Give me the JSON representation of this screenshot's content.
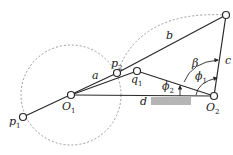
{
  "diagram": {
    "type": "four-bar linkage geometry",
    "colors": {
      "line": "#2a2a2a",
      "dashed": "#9a9a9a",
      "ground": "#b5b5b5"
    },
    "points": {
      "O1": {
        "label": "O",
        "sub": "1"
      },
      "O2": {
        "label": "O",
        "sub": "2"
      },
      "p1": {
        "label": "p",
        "sub": "1"
      },
      "p2": {
        "label": "p",
        "sub": "2"
      },
      "q1": {
        "label": "q",
        "sub": "1"
      }
    },
    "links": {
      "a": "a",
      "b": "b",
      "c": "c",
      "d": "d"
    },
    "angles": {
      "beta": "β",
      "phi1": {
        "label": "ϕ",
        "sub": "1"
      },
      "phi2": {
        "label": "ϕ",
        "sub": "2"
      }
    }
  }
}
